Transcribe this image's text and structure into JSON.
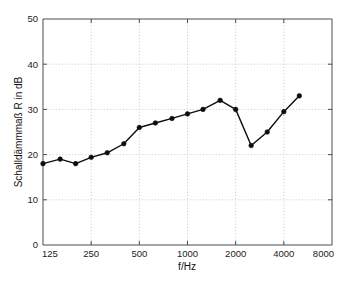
{
  "chart_data": {
    "type": "line",
    "title": "",
    "subtitle": "",
    "xlabel": "f/Hz",
    "ylabel": "Schalldämmmaß R in dB",
    "xscale": "log",
    "yscale": "linear",
    "xlim": [
      125,
      8000
    ],
    "ylim": [
      0,
      50
    ],
    "grid": true,
    "legend": null,
    "xticks": [
      125,
      250,
      500,
      1000,
      2000,
      4000,
      8000
    ],
    "xtick_labels": [
      "125",
      "250",
      "500",
      "1000",
      "2000",
      "4000",
      "8000"
    ],
    "yticks": [
      0,
      10,
      20,
      30,
      40,
      50
    ],
    "ytick_labels": [
      "0",
      "10",
      "20",
      "30",
      "40",
      "50"
    ],
    "marker": "filled-circle",
    "line_color": "#0d0d0d",
    "marker_color": "#0d0d0d",
    "grid_color": "#b8b8b8",
    "axis_color": "#4d4d4d",
    "background_color": "#ffffff",
    "x": [
      125,
      160,
      200,
      250,
      315,
      400,
      500,
      630,
      800,
      1000,
      1250,
      1600,
      2000,
      2500,
      3150,
      4000,
      5000
    ],
    "y": [
      18,
      19,
      18,
      19.4,
      20.4,
      22.4,
      26,
      27,
      28,
      29,
      30,
      32,
      30,
      22,
      25,
      29.5,
      33
    ],
    "series": [
      {
        "name": "Schalldämmmaß R",
        "x": [
          125,
          160,
          200,
          250,
          315,
          400,
          500,
          630,
          800,
          1000,
          1250,
          1600,
          2000,
          2500,
          3150,
          4000,
          5000
        ],
        "values": [
          18,
          19,
          18,
          19.4,
          20.4,
          22.4,
          26,
          27,
          28,
          29,
          30,
          32,
          30,
          22,
          25,
          29.5,
          33
        ]
      }
    ]
  }
}
